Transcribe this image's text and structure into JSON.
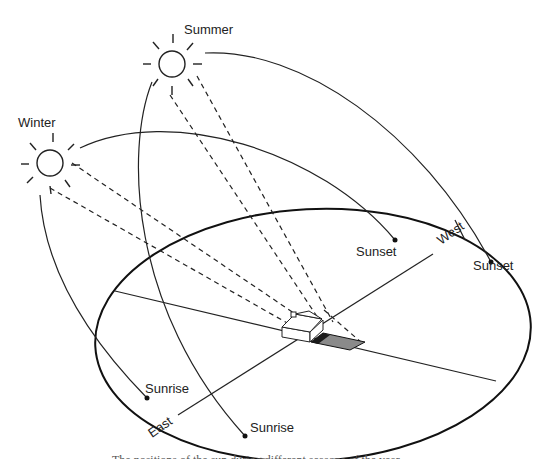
{
  "diagram": {
    "labels": {
      "summer": "Summer",
      "winter": "Winter",
      "sunset_winter": "Sunset",
      "sunset_summer": "Sunset",
      "sunrise_winter": "Sunrise",
      "sunrise_summer": "Sunrise",
      "east": "East",
      "west": "West"
    },
    "caption": "The positions of the sun during different seasons of the year",
    "suns": [
      {
        "name": "summer",
        "icon": "sun-icon"
      },
      {
        "name": "winter",
        "icon": "sun-icon"
      }
    ],
    "colors": {
      "line": "#222222",
      "shadow_dark": "#1a1a1a",
      "shadow_light": "#8a8a8a"
    }
  }
}
